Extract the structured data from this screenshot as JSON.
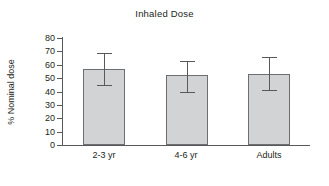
{
  "chart_data": {
    "type": "bar",
    "title": "Inhaled Dose",
    "xlabel": "",
    "ylabel": "% Nominal dose",
    "categories": [
      "2-3 yr",
      "4-6 yr",
      "Adults"
    ],
    "values": [
      57,
      52,
      53
    ],
    "error_upper": [
      69,
      63,
      66
    ],
    "error_lower": [
      45,
      40,
      41
    ],
    "error_bars": [
      {
        "category": "2-3 yr",
        "value": 57,
        "upper": 69,
        "lower": 45
      },
      {
        "category": "4-6 yr",
        "value": 52,
        "upper": 63,
        "lower": 40
      },
      {
        "category": "Adults",
        "value": 53,
        "upper": 66,
        "lower": 41
      }
    ],
    "ylim": [
      0,
      80
    ],
    "ytick_values": [
      0,
      10,
      20,
      30,
      40,
      50,
      60,
      70,
      80
    ],
    "ytick_labels": [
      "0",
      "10",
      "20",
      "30",
      "40",
      "50",
      "60",
      "70",
      "80"
    ],
    "grid": false,
    "legend": null,
    "legend_position": "none",
    "colors": {
      "bar_fill": "#d2d3d5",
      "bar_stroke": "#6d6e71",
      "axis": "#58595b",
      "text": "#231f20",
      "background": "#ffffff"
    }
  }
}
